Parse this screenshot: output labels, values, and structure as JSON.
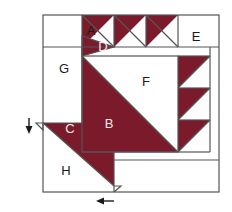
{
  "diagram": {
    "type": "quilt-block-piecing-diagram",
    "colors": {
      "fabric_dark": "#7B1A2B",
      "fabric_light": "#FFFFFF",
      "outline": "#555555",
      "label_dark": "#1A1A1A",
      "label_light": "#F7E8EC",
      "background": "#FFFFFF"
    },
    "labels": [
      {
        "id": "A",
        "text": "A",
        "tone": "dark",
        "x": 91,
        "y": 35,
        "region": "top-row-white-corner"
      },
      {
        "id": "B",
        "text": "B",
        "tone": "light",
        "x": 109,
        "y": 128,
        "region": "center-square-dark-half"
      },
      {
        "id": "C",
        "text": "C",
        "tone": "light",
        "x": 70,
        "y": 133,
        "region": "lower-left-dark-triangle"
      },
      {
        "id": "D",
        "text": "D",
        "tone": "light",
        "x": 103,
        "y": 51,
        "region": "top-row-dark-triangle"
      },
      {
        "id": "E",
        "text": "E",
        "tone": "dark",
        "x": 196,
        "y": 41,
        "region": "top-right-white-square"
      },
      {
        "id": "F",
        "text": "F",
        "tone": "dark",
        "x": 146,
        "y": 86,
        "region": "center-square-light-half"
      },
      {
        "id": "G",
        "text": "G",
        "tone": "dark",
        "x": 64,
        "y": 73,
        "region": "left-white-rectangle"
      },
      {
        "id": "H",
        "text": "H",
        "tone": "dark",
        "x": 66,
        "y": 175,
        "region": "bottom-white-rectangle"
      }
    ],
    "arrows": [
      {
        "id": "left-arrow",
        "direction": "down",
        "x": 29,
        "y": 124,
        "note": "seam direction marker at left edge"
      },
      {
        "id": "bottom-arrow",
        "direction": "left",
        "x": 104,
        "y": 201,
        "note": "seam direction marker at bottom edge"
      }
    ],
    "geometry": {
      "outer_border": {
        "x": 43,
        "y": 15,
        "width": 176,
        "height": 177
      },
      "center_square": {
        "x": 82,
        "y": 56,
        "width": 96,
        "height": 96
      },
      "top_triangle_units": 3,
      "right_triangle_units": 3
    }
  }
}
